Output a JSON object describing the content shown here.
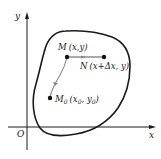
{
  "diagram": {
    "title": "",
    "axes": {
      "x_label": "x",
      "y_label": "y",
      "origin_label": "O"
    },
    "points": [
      {
        "id": "M",
        "name": "M",
        "coords": "(x,y)"
      },
      {
        "id": "N",
        "name": "N",
        "coords": "(x+Δx, y)"
      },
      {
        "id": "M0",
        "name": "M",
        "subscript": "0",
        "coords_open": "(x",
        "coords_sub1": "0",
        "coords_mid": ", y",
        "coords_sub2": "0",
        "coords_close": ")"
      }
    ],
    "region": "closed curve region D",
    "colors": {
      "stroke": "#1a1a1a",
      "path": "#888888",
      "background": "#ffffff"
    }
  }
}
